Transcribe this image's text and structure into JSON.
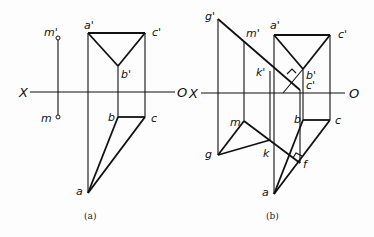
{
  "figure_a": {
    "caption": "(a)",
    "axis": {
      "left": "X",
      "right": "O"
    },
    "labels": {
      "m_prime": "m'",
      "m": "m",
      "a_prime": "a'",
      "b_prime": "b'",
      "c_prime": "c'",
      "a": "a",
      "b": "b",
      "c": "c"
    }
  },
  "figure_b": {
    "caption": "(b)",
    "axis": {
      "left": "X",
      "right": "O"
    },
    "labels": {
      "g_prime": "g'",
      "m_prime": "m'",
      "k_prime": "k'",
      "a_prime": "a'",
      "b_prime": "b'",
      "c_prime": "c'",
      "c_prime2": "c'",
      "g": "g",
      "m": "m",
      "k": "k",
      "a": "a",
      "b": "b",
      "c": "c",
      "f": "f"
    }
  }
}
